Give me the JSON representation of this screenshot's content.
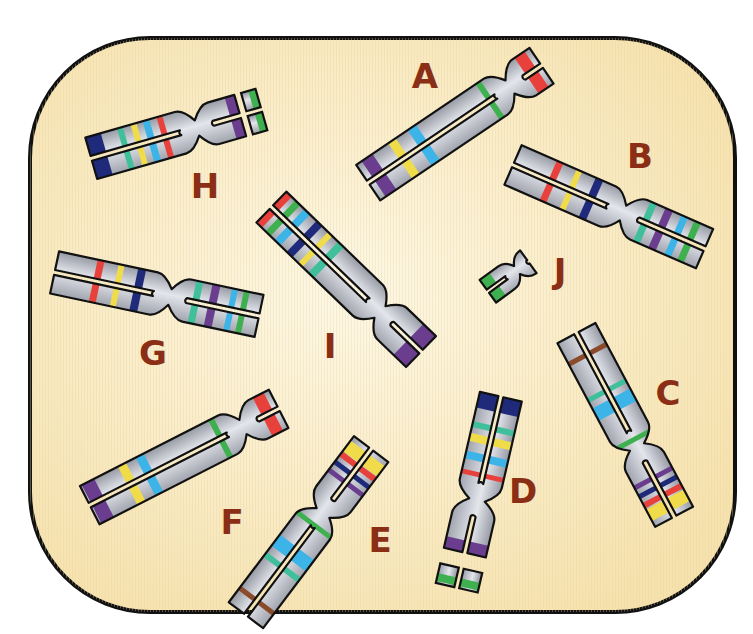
{
  "caption": "",
  "frame": {
    "x": 30,
    "y": 38,
    "width": 705,
    "height": 574,
    "radius": 120,
    "fill_center": "#fdf6e2",
    "fill_edge": "#f7e4b2",
    "stroke": "#111111"
  },
  "colors": {
    "red": "#e8413c",
    "green": "#3fb04f",
    "blue": "#3cb4e8",
    "yellow": "#f0dc4a",
    "purple": "#6a3d8f",
    "navy": "#1f2a7a",
    "teal": "#3fbf9a",
    "brown": "#8a4b2a",
    "label": "#8b2e16"
  },
  "chromosomes": [
    {
      "label": "A",
      "labelPos": [
        425,
        78
      ],
      "cx": 510,
      "cy": 87,
      "angle": -34,
      "long": 171,
      "short": 38,
      "bandsLong": [
        [
          24,
          6,
          "green"
        ],
        [
          104,
          10,
          "blue"
        ],
        [
          128,
          9,
          "yellow"
        ],
        [
          158,
          13,
          "purple"
        ]
      ],
      "bandsShort": [
        [
          26,
          12,
          "red"
        ]
      ]
    },
    {
      "label": "B",
      "labelPos": [
        640,
        158
      ],
      "cx": 623,
      "cy": 213,
      "angle": 23.6,
      "long": 120,
      "short": 89,
      "bandsLong": [
        [
          35,
          8,
          "navy"
        ],
        [
          57,
          6,
          "yellow"
        ],
        [
          78,
          7,
          "red"
        ]
      ],
      "bandsShort": [
        [
          24,
          7,
          "teal"
        ],
        [
          41,
          8,
          "purple"
        ],
        [
          58,
          7,
          "blue"
        ],
        [
          72,
          7,
          "green"
        ]
      ]
    },
    {
      "label": "C",
      "labelPos": [
        668,
        395
      ],
      "cx": 637,
      "cy": 447,
      "angle": 62,
      "long": 129,
      "short": 79,
      "bandsLong": [
        [
          8,
          5,
          "green"
        ],
        [
          48,
          14,
          "blue"
        ],
        [
          64,
          5,
          "teal"
        ],
        [
          105,
          5,
          "brown"
        ]
      ],
      "bandsShort": [
        [
          35,
          5,
          "purple"
        ],
        [
          45,
          5,
          "navy"
        ],
        [
          55,
          6,
          "red"
        ],
        [
          66,
          13,
          "yellow"
        ]
      ]
    },
    {
      "label": "D",
      "labelPos": [
        523,
        493
      ],
      "cx": 477,
      "cy": 500,
      "angle": 103,
      "long": 106,
      "short": 54,
      "bandsLong": [
        [
          25,
          5,
          "red"
        ],
        [
          42,
          8,
          "blue"
        ],
        [
          60,
          8,
          "yellow"
        ],
        [
          73,
          6,
          "teal"
        ],
        [
          98,
          16,
          "navy"
        ]
      ],
      "bandsShort": [
        [
          48,
          12,
          "purple"
        ]
      ],
      "fragment": {
        "from": 70,
        "to": 90,
        "band": [
          84,
          8,
          "green"
        ]
      }
    },
    {
      "label": "E",
      "labelPos": [
        380,
        542
      ],
      "cx": 323,
      "cy": 513,
      "angle": -53,
      "long": 128,
      "short": 80,
      "bandsLong": [
        [
          15,
          5,
          "green"
        ],
        [
          50,
          14,
          "blue"
        ],
        [
          68,
          6,
          "teal"
        ],
        [
          110,
          5,
          "brown"
        ]
      ],
      "bandsShort": [
        [
          38,
          5,
          "purple"
        ],
        [
          48,
          5,
          "navy"
        ],
        [
          58,
          6,
          "red"
        ],
        [
          68,
          13,
          "yellow"
        ]
      ],
      "flipLong": true
    },
    {
      "label": "F",
      "labelPos": [
        232,
        524
      ],
      "cx": 243,
      "cy": 427,
      "angle": -27,
      "long": 172,
      "short": 40,
      "bandsLong": [
        [
          25,
          6,
          "green"
        ],
        [
          105,
          9,
          "blue"
        ],
        [
          125,
          9,
          "yellow"
        ],
        [
          163,
          14,
          "purple"
        ]
      ],
      "bandsShort": [
        [
          28,
          12,
          "red"
        ]
      ]
    },
    {
      "label": "G",
      "labelPos": [
        153,
        355
      ],
      "cx": 170,
      "cy": 297,
      "angle": 12,
      "long": 118,
      "short": 91,
      "bandsLong": [
        [
          33,
          8,
          "navy"
        ],
        [
          54,
          6,
          "yellow"
        ],
        [
          75,
          7,
          "red"
        ]
      ],
      "bandsShort": [
        [
          26,
          7,
          "teal"
        ],
        [
          43,
          8,
          "purple"
        ],
        [
          62,
          6,
          "blue"
        ],
        [
          74,
          6,
          "green"
        ]
      ]
    },
    {
      "label": "H",
      "labelPos": [
        205,
        188
      ],
      "cx": 197,
      "cy": 128,
      "angle": -16,
      "long": 110,
      "short": 45,
      "bandsLong": [
        [
          33,
          6,
          "red"
        ],
        [
          47,
          7,
          "blue"
        ],
        [
          60,
          6,
          "yellow"
        ],
        [
          74,
          6,
          "teal"
        ],
        [
          102,
          16,
          "navy"
        ]
      ],
      "bandsShort": [
        [
          40,
          10,
          "purple"
        ]
      ],
      "fragment": {
        "from": 52,
        "to": 67,
        "band": [
          63,
          7,
          "green"
        ]
      }
    },
    {
      "label": "I",
      "labelPos": [
        330,
        348
      ],
      "cx": 380,
      "cy": 312,
      "angle": 44,
      "long": 151,
      "short": 57,
      "bandsLong": [
        [
          75,
          8,
          "teal"
        ],
        [
          90,
          6,
          "yellow"
        ],
        [
          105,
          8,
          "navy"
        ],
        [
          122,
          8,
          "blue"
        ],
        [
          135,
          7,
          "green"
        ],
        [
          147,
          7,
          "red"
        ]
      ],
      "bandsShort": [
        [
          48,
          17,
          "purple"
        ]
      ]
    },
    {
      "label": "J",
      "labelPos": [
        560,
        273
      ],
      "cx": 517,
      "cy": 270,
      "angle": -36,
      "long": 36,
      "short": 14,
      "bandsLong": [
        [
          30,
          12,
          "green"
        ]
      ],
      "bandsShort": [],
      "small": true
    }
  ]
}
